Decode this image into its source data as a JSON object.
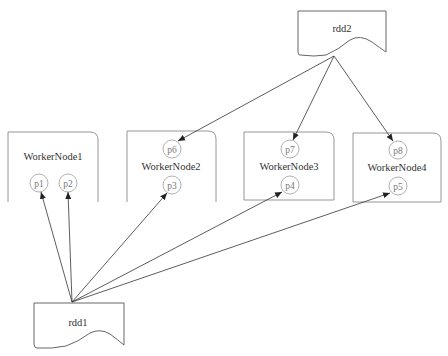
{
  "diagram": {
    "type": "rdd-partition-distribution",
    "nodes": {
      "rdd1": {
        "label": "rdd1",
        "shape": "document"
      },
      "rdd2": {
        "label": "rdd2",
        "shape": "document"
      },
      "workers": [
        {
          "label": "WorkerNode1",
          "partitions": [
            "p1",
            "p2"
          ]
        },
        {
          "label": "WorkerNode2",
          "partitions": [
            "p6",
            "p3"
          ]
        },
        {
          "label": "WorkerNode3",
          "partitions": [
            "p7",
            "p4"
          ]
        },
        {
          "label": "WorkerNode4",
          "partitions": [
            "p8",
            "p5"
          ]
        }
      ]
    },
    "partitions": {
      "p1": "p1",
      "p2": "p2",
      "p3": "p3",
      "p4": "p4",
      "p5": "p5",
      "p6": "p6",
      "p7": "p7",
      "p8": "p8"
    },
    "edges": [
      {
        "from": "rdd1",
        "to": "p1"
      },
      {
        "from": "rdd1",
        "to": "p2"
      },
      {
        "from": "rdd1",
        "to": "p3"
      },
      {
        "from": "rdd1",
        "to": "p4"
      },
      {
        "from": "rdd1",
        "to": "p5"
      },
      {
        "from": "rdd2",
        "to": "p6"
      },
      {
        "from": "rdd2",
        "to": "p7"
      },
      {
        "from": "rdd2",
        "to": "p8"
      }
    ],
    "colors": {
      "box_stroke": "#8a8a8a",
      "circle_stroke": "#a8a8a8",
      "edge": "#333333",
      "text": "#333333"
    }
  }
}
